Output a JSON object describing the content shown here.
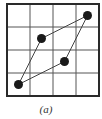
{
  "diagram": {
    "type": "grid-quadrilateral",
    "grid": {
      "rows": 4,
      "cols": 4,
      "origin_px": [
        7,
        4
      ],
      "cell_px": 23,
      "border_color": "#2a2a2a",
      "line_color": "#555555"
    },
    "points_grid_units": [
      {
        "id": "p1",
        "col": 0.5,
        "row": 3.5
      },
      {
        "id": "p2",
        "col": 1.5,
        "row": 1.5
      },
      {
        "id": "p3",
        "col": 3.5,
        "row": 0.5
      },
      {
        "id": "p4",
        "col": 2.5,
        "row": 2.5
      }
    ],
    "polygon_order": [
      "p1",
      "p2",
      "p3",
      "p4"
    ],
    "point_color": "#1a1a1a",
    "edge_color": "#444444",
    "caption": "(a)"
  }
}
